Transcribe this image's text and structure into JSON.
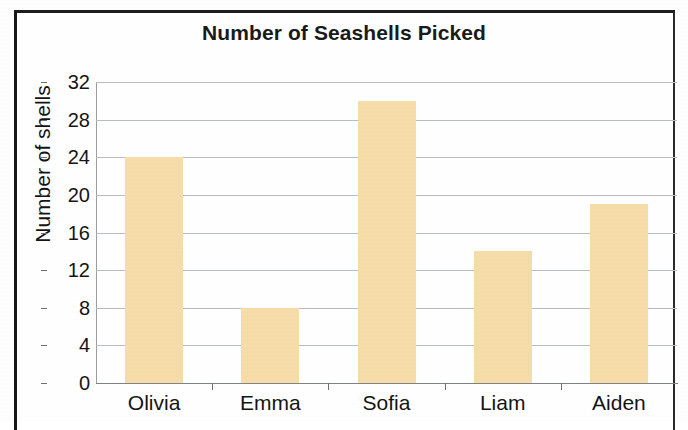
{
  "chart_data": {
    "type": "bar",
    "title": "Number of Seashells Picked",
    "xlabel": "",
    "ylabel": "Number of shells",
    "categories": [
      "Olivia",
      "Emma",
      "Sofia",
      "Liam",
      "Aiden"
    ],
    "values": [
      24,
      8,
      30,
      14,
      19
    ],
    "ylim": [
      0,
      32
    ],
    "ytick_step": 4,
    "yticks": [
      0,
      4,
      8,
      12,
      16,
      20,
      24,
      28,
      32
    ],
    "ytick_labels": [
      "0",
      "4",
      "8",
      "12",
      "16",
      "20",
      "24",
      "28",
      "32"
    ],
    "grid": true,
    "grid_axis": "y",
    "legend": false,
    "bar_color": "#F5DCA8",
    "text_color": "#141414",
    "gridline_color": "#B9BCC0",
    "axis_color": "#8D9095",
    "background_color": "#FFFFFF",
    "frame_color": "#1A1A1A",
    "series": [
      {
        "name": "Number of shells",
        "values": [
          24,
          8,
          30,
          14,
          19
        ]
      }
    ]
  }
}
